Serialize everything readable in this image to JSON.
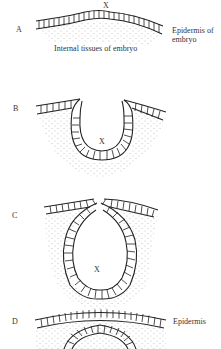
{
  "figure": {
    "stages": [
      {
        "id": "A",
        "label": "A",
        "x_marker": "X",
        "annotations": [
          "Epidermis of",
          "embryo"
        ],
        "sub_label": "Internal tissues of embryo"
      },
      {
        "id": "B",
        "label": "B",
        "x_marker": "X"
      },
      {
        "id": "C",
        "label": "C",
        "x_marker": "X"
      },
      {
        "id": "D",
        "label": "D",
        "annotations": [
          "Epidermis"
        ]
      }
    ]
  },
  "colors": {
    "ink": "#222222",
    "stipple": "#888888",
    "background": "#ffffff"
  }
}
